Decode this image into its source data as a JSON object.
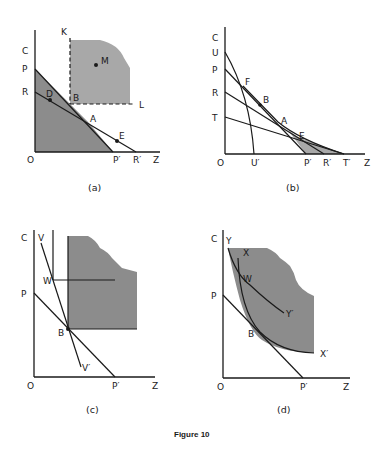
{
  "figure": {
    "caption": "Figure 10",
    "colors": {
      "ink": "#1a1a1a",
      "shade_dark": "#8c8c8c",
      "shade_light": "#b4b4b4",
      "background": "#ffffff"
    }
  },
  "panels": {
    "a": {
      "caption": "(a)",
      "axis_y": "C",
      "axis_x": "Z",
      "origin": "O",
      "labels": {
        "P": "P",
        "R": "R",
        "K": "K",
        "M": "M",
        "D": "D",
        "B": "B",
        "L": "L",
        "A": "A",
        "E": "E",
        "P_prime": "P′",
        "R_prime": "R′"
      }
    },
    "b": {
      "caption": "(b)",
      "axis_y": "C",
      "axis_x": "Z",
      "origin": "O",
      "labels": {
        "U": "U",
        "P": "P",
        "R": "R",
        "T": "T",
        "F": "F",
        "B": "B",
        "A": "A",
        "E": "E",
        "U_prime": "U′",
        "P_prime": "P′",
        "R_prime": "R′",
        "T_prime": "T′"
      }
    },
    "c": {
      "caption": "(c)",
      "axis_y": "C",
      "axis_x": "Z",
      "origin": "O",
      "labels": {
        "V": "V",
        "W": "W",
        "P": "P",
        "B": "B",
        "V_prime": "V′",
        "P_prime": "P′"
      }
    },
    "d": {
      "caption": "(d)",
      "axis_y": "C",
      "axis_x": "Z",
      "origin": "O",
      "labels": {
        "Y": "Y",
        "X": "X",
        "W": "W",
        "Y_prime": "Y′",
        "P": "P",
        "B": "B",
        "X_prime": "X′",
        "P_prime": "P′"
      }
    }
  }
}
